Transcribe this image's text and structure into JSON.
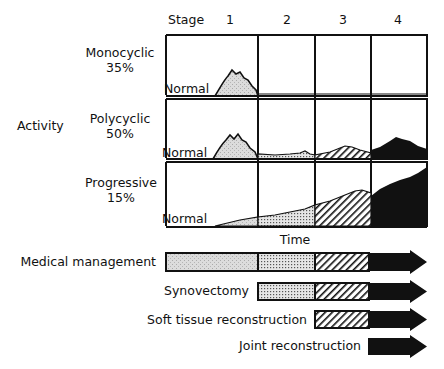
{
  "header": {
    "stage_label": "Stage",
    "stages": [
      "1",
      "2",
      "3",
      "4"
    ]
  },
  "rows": [
    {
      "name": "Monocyclic",
      "percent": "35%",
      "baseline_label": "Normal"
    },
    {
      "name": "Polycyclic",
      "percent": "50%",
      "baseline_label": "Normal"
    },
    {
      "name": "Progressive",
      "percent": "15%",
      "baseline_label": "Normal"
    }
  ],
  "y_axis_label": "Activity",
  "x_axis_label": "Time",
  "treatments": [
    {
      "label": "Medical management",
      "starts_at_stage": 1
    },
    {
      "label": "Synovectomy",
      "starts_at_stage": 2
    },
    {
      "label": "Soft tissue reconstruction",
      "starts_at_stage": 3
    },
    {
      "label": "Joint reconstruction",
      "starts_at_stage": 4
    }
  ],
  "stage_fills": {
    "1": "light-stipple",
    "2": "dense-dots",
    "3": "diagonal-hatch",
    "4": "solid-black"
  },
  "colors": {
    "ink": "#111111",
    "stage1_fill": "#d8d8d8",
    "background": "#ffffff"
  }
}
